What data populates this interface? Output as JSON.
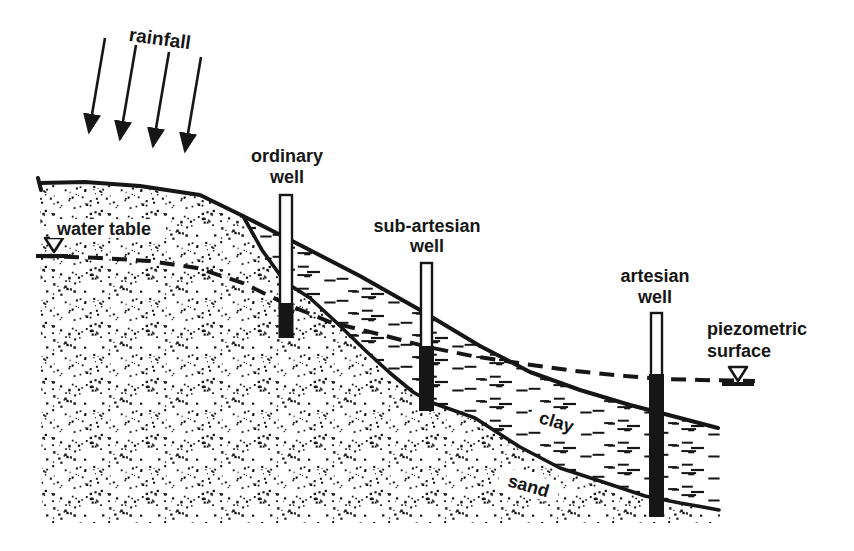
{
  "figure": {
    "type": "hydrogeology-cross-section",
    "background_color": "#ffffff",
    "ink_color": "#161616",
    "labels": {
      "rainfall": "rainfall",
      "ordinary_well": [
        "ordinary",
        "well"
      ],
      "sub_artesian_well": [
        "sub-artesian",
        "well"
      ],
      "artesian_well": [
        "artesian",
        "well"
      ],
      "piezometric_surface": [
        "piezometric",
        "surface"
      ],
      "water_table": "water table",
      "clay": "clay",
      "sand": "sand"
    },
    "symbols": {
      "rainfall_arrows": {
        "count": 4,
        "direction": "down-left"
      },
      "water_table_marker": "inverted-triangle",
      "piezometric_marker": "inverted-triangle",
      "water_line_style": "dashed"
    },
    "layers": [
      {
        "name": "sand",
        "texture": "stipple-dots"
      },
      {
        "name": "clay",
        "texture": "horizontal-dashes"
      }
    ],
    "wells": [
      "ordinary well",
      "sub-artesian well",
      "artesian well"
    ]
  }
}
